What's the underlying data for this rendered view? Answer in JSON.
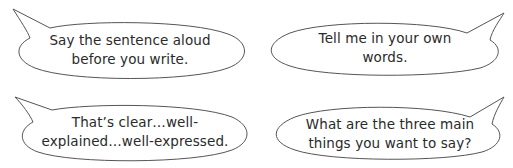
{
  "bubbles": [
    {
      "id": "top-left",
      "lines": [
        "Say the sentence aloud",
        "before you write."
      ],
      "tail_direction": "upper-left"
    },
    {
      "id": "top-right",
      "lines": [
        "Tell me in your own",
        "words."
      ],
      "tail_direction": "upper-right"
    },
    {
      "id": "bottom-left",
      "lines": [
        "That’s clear…well-",
        "explained…well-expressed."
      ],
      "tail_direction": "upper-left"
    },
    {
      "id": "bottom-right",
      "lines": [
        "What are the three main",
        "things you want to say?"
      ],
      "tail_direction": "upper-right"
    }
  ],
  "colors": {
    "outline": "#555555",
    "text": "#2a2a2a",
    "background": "#ffffff"
  }
}
